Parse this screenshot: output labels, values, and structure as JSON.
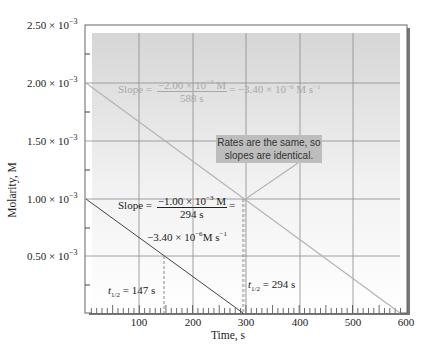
{
  "chart_data": {
    "type": "line",
    "title": "",
    "xlabel": "Time, s",
    "ylabel": "Molarity, M",
    "xlim": [
      0,
      600
    ],
    "ylim": [
      0,
      0.0025
    ],
    "grid": true,
    "x_ticks": [
      "100",
      "200",
      "300",
      "400",
      "500",
      "600"
    ],
    "y_ticks": [
      "0.50 × 10^-3",
      "1.00 × 10^-3",
      "1.50 × 10^-3",
      "2.00 × 10^-3",
      "2.50 × 10^-3"
    ],
    "series": [
      {
        "name": "Initial 2.00e-3 M",
        "color": "#b0b0b0",
        "x": [
          0,
          588
        ],
        "y": [
          0.002,
          0.0
        ]
      },
      {
        "name": "Initial 1.00e-3 M",
        "color": "#444444",
        "x": [
          0,
          294
        ],
        "y": [
          0.001,
          0.0
        ]
      }
    ],
    "annotations": [
      {
        "text": "Slope = −2.00 × 10^-3 M / 588 s = −3.40 × 10^-6 M s^-1",
        "color": "#a8a8a8"
      },
      {
        "text": "Slope = −1.00 × 10^-3 M / 294 s = −3.40 × 10^-6 M s^-1",
        "color": "#222222"
      },
      {
        "text": "t1/2 = 147 s",
        "x": 147
      },
      {
        "text": "t1/2 = 294 s",
        "x": 294
      },
      {
        "text": "Rates are the same, so slopes are identical."
      }
    ]
  },
  "axes": {
    "xlabel": "Time, s",
    "ylabel": "Molarity, M",
    "x_ticks": [
      "100",
      "200",
      "300",
      "400",
      "500",
      "600"
    ],
    "y_ticks": [
      {
        "mant": "2.50 × 10",
        "exp": "−3"
      },
      {
        "mant": "2.00 × 10",
        "exp": "−3"
      },
      {
        "mant": "1.50 × 10",
        "exp": "−3"
      },
      {
        "mant": "1.00 × 10",
        "exp": "−3"
      },
      {
        "mant": "0.50 × 10",
        "exp": "−3"
      }
    ]
  },
  "annotations": {
    "slope_top": {
      "lhs": "Slope = ",
      "num_mant": "−2.00 × 10",
      "num_exp": "−3",
      "num_unit": " M",
      "den": "588 s",
      "rhs_mant": "= −3.40 × 10",
      "rhs_exp": "−6",
      "rhs_unit": " M s",
      "rhs_unit_exp": "−1"
    },
    "slope_bottom": {
      "lhs": "Slope = ",
      "num_mant": "−1.00 × 10",
      "num_exp": "−3",
      "num_unit": " M",
      "den": "294 s",
      "eq": "=",
      "rhs_mant": "−3.40 × 10",
      "rhs_exp": "−6",
      "rhs_unit": "M s",
      "rhs_unit_exp": "−1"
    },
    "half_life_1": {
      "t": "t",
      "sub": "1/2",
      "val": " = 147 s"
    },
    "half_life_2": {
      "t": "t",
      "sub": "1/2",
      "val": " = 294 s"
    },
    "callout": {
      "line1": "Rates are the same, so",
      "line2": "slopes are identical."
    }
  }
}
